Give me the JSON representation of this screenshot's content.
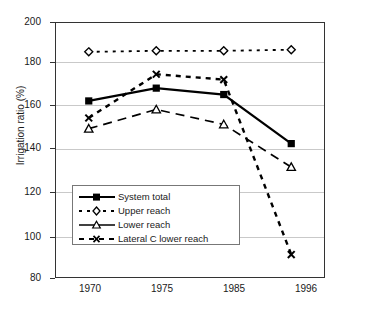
{
  "chart_data": {
    "type": "line",
    "title": "",
    "xlabel": "",
    "ylabel": "Irrigation ratio (%)",
    "categories": [
      "1970",
      "1975",
      "1985",
      "1996"
    ],
    "ylim": [
      80,
      200
    ],
    "yticks": [
      80,
      100,
      120,
      140,
      160,
      180,
      200
    ],
    "grid": true,
    "legend_position": "inside-lower-left",
    "series": [
      {
        "name": "System total",
        "values": [
          163,
          169,
          166,
          143
        ],
        "marker": "filled-square",
        "line": "solid",
        "color": "#000000"
      },
      {
        "name": "Upper reach",
        "values": [
          186,
          186.5,
          186.5,
          187
        ],
        "marker": "open-diamond",
        "line": "dotted",
        "color": "#000000"
      },
      {
        "name": "Lower reach",
        "values": [
          150,
          159,
          152,
          132
        ],
        "marker": "open-triangle",
        "line": "dashed-long",
        "color": "#000000"
      },
      {
        "name": "Lateral C lower reach",
        "values": [
          155,
          175.5,
          173,
          91
        ],
        "marker": "cross-x",
        "line": "dashed-short",
        "color": "#000000"
      }
    ]
  },
  "axis": {
    "y_tick_labels": [
      "200",
      "180",
      "160",
      "140",
      "120",
      "100",
      "80"
    ],
    "y_axis_title": "Irrigation ratio (%)",
    "x_tick_labels": [
      "1970",
      "1975",
      "1985",
      "1996"
    ]
  },
  "legend": {
    "entries": [
      {
        "label": "System total"
      },
      {
        "label": "Upper reach"
      },
      {
        "label": "Lower reach"
      },
      {
        "label": "Lateral C lower reach"
      }
    ]
  }
}
